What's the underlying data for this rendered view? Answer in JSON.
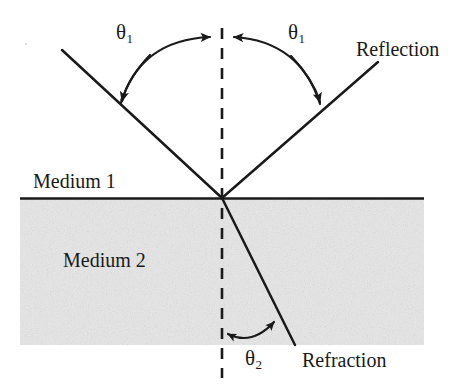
{
  "diagram": {
    "background_color": "#ffffff",
    "ink_color": "#1a1a1a",
    "medium2_fill": "#e2e2e2",
    "labels": {
      "theta1_left": "θ",
      "theta1_left_sub": "1",
      "theta1_right": "θ",
      "theta1_right_sub": "1",
      "theta2": "θ",
      "theta2_sub": "2",
      "medium1": "Medium 1",
      "medium2": "Medium 2",
      "reflection": "Reflection",
      "refraction": "Refraction"
    },
    "geometry": {
      "incidence_point": [
        222,
        198
      ],
      "interface_y": 198,
      "interface_x_start": 20,
      "interface_x_end": 424,
      "normal_x": 222,
      "normal_y_top": 28,
      "normal_y_bottom": 378,
      "incident_ray_start": [
        62,
        50
      ],
      "reflected_ray_end": [
        378,
        62
      ],
      "refracted_ray_end": [
        295,
        345
      ],
      "medium2_top": 198,
      "medium2_bottom": 345,
      "medium2_left": 20,
      "medium2_right": 424
    },
    "icons": {
      "incident_arrow": "arrowhead-down-right",
      "reflected_arrow": "arrowhead-down-left",
      "theta1_left_arc_arrow": "arrowhead-right",
      "theta1_right_arc_arrow": "arrowhead-left",
      "theta2_arc_arrows": "arrowhead-both-ends"
    }
  }
}
